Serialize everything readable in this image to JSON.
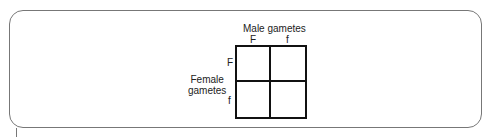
{
  "diagram": {
    "type": "punnett-square",
    "male_label": "Male gametes",
    "female_label_line1": "Female",
    "female_label_line2": "gametes",
    "columns": [
      "F",
      "f"
    ],
    "rows": [
      "F",
      "f"
    ],
    "cells": [
      [
        "",
        ""
      ],
      [
        "",
        ""
      ]
    ]
  }
}
